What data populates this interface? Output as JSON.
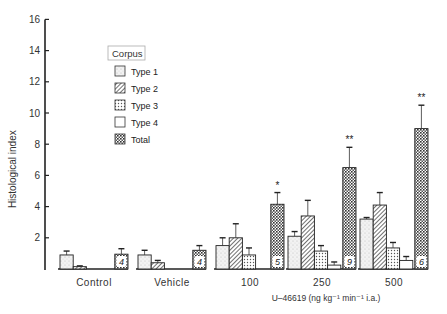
{
  "chart_data": {
    "type": "bar",
    "title": "",
    "xlabel": "U–46619 (ng kg⁻¹ min⁻¹ i.a.)",
    "ylabel": "Histological index",
    "ylim": [
      0,
      16
    ],
    "yticks": [
      2,
      4,
      6,
      8,
      10,
      12,
      14,
      16
    ],
    "grid": false,
    "legend_title": "Corpus",
    "legend_position": "upper-left",
    "categories": [
      "Control",
      "Vehicle",
      "100",
      "250",
      "500"
    ],
    "series": [
      {
        "name": "Type 1",
        "pattern": "stipple",
        "values": [
          0.9,
          0.9,
          1.5,
          2.1,
          3.2
        ],
        "errors": [
          0.25,
          0.3,
          0.5,
          0.3,
          0.1
        ]
      },
      {
        "name": "Type 2",
        "pattern": "hatch",
        "values": [
          0.15,
          0.4,
          2.0,
          3.4,
          4.1
        ],
        "errors": [
          0.05,
          0.15,
          0.9,
          1.0,
          0.8
        ]
      },
      {
        "name": "Type 3",
        "pattern": "dots",
        "values": [
          0.0,
          0.0,
          0.9,
          1.15,
          1.35
        ],
        "errors": [
          0,
          0,
          0.45,
          0.35,
          0.35
        ]
      },
      {
        "name": "Type 4",
        "pattern": "open",
        "values": [
          0.0,
          0.0,
          0.0,
          0.25,
          0.55
        ],
        "errors": [
          0,
          0,
          0,
          0.2,
          0.25
        ]
      },
      {
        "name": "Total",
        "pattern": "crosshatch",
        "values": [
          0.95,
          1.2,
          4.15,
          6.5,
          9.0
        ],
        "errors": [
          0.35,
          0.3,
          0.75,
          1.3,
          1.5
        ]
      }
    ],
    "n_labels": [
      "4",
      "4",
      "5",
      "9",
      "6"
    ],
    "significance": [
      "",
      "",
      "*",
      "**",
      "**"
    ]
  }
}
